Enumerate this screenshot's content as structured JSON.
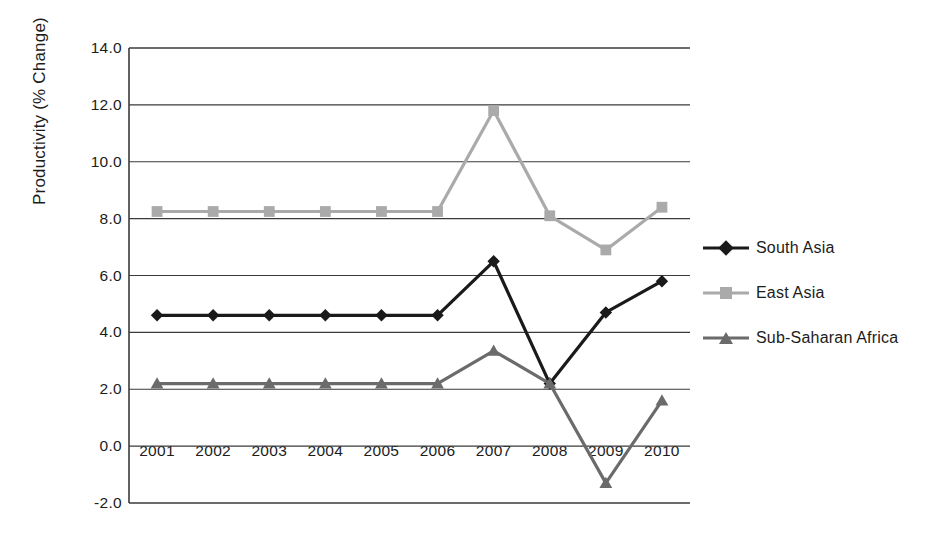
{
  "chart_data": {
    "type": "line",
    "title": "",
    "xlabel": "",
    "ylabel": "Productivity (% Change)",
    "categories": [
      "2001",
      "2002",
      "2003",
      "2004",
      "2005",
      "2006",
      "2007",
      "2008",
      "2009",
      "2010"
    ],
    "ylim": [
      -2.0,
      14.0
    ],
    "ytick_labels": [
      "14.0",
      "12.0",
      "10.0",
      "8.0",
      "6.0",
      "4.0",
      "2.0",
      "0.0",
      "-2.0"
    ],
    "ytick_values": [
      14.0,
      12.0,
      10.0,
      8.0,
      6.0,
      4.0,
      2.0,
      0.0,
      -2.0
    ],
    "grid": true,
    "legend_position": "right",
    "series": [
      {
        "name": "South Asia",
        "color": "#1a1a1a",
        "marker": "diamond",
        "values": [
          4.6,
          4.6,
          4.6,
          4.6,
          4.6,
          4.6,
          6.5,
          2.2,
          4.7,
          5.8
        ]
      },
      {
        "name": "East Asia",
        "color": "#aaaaaa",
        "marker": "square",
        "values": [
          8.25,
          8.25,
          8.25,
          8.25,
          8.25,
          8.25,
          11.8,
          8.1,
          6.9,
          8.4
        ]
      },
      {
        "name": "Sub-Saharan Africa",
        "color": "#6b6b6b",
        "marker": "triangle",
        "values": [
          2.2,
          2.2,
          2.2,
          2.2,
          2.2,
          2.2,
          3.35,
          2.2,
          -1.3,
          1.6
        ]
      }
    ]
  },
  "legend": {
    "items": [
      {
        "label": "South Asia"
      },
      {
        "label": "East Asia"
      },
      {
        "label": "Sub-Saharan Africa"
      }
    ]
  },
  "axis": {
    "y_title": "Productivity (% Change)"
  }
}
